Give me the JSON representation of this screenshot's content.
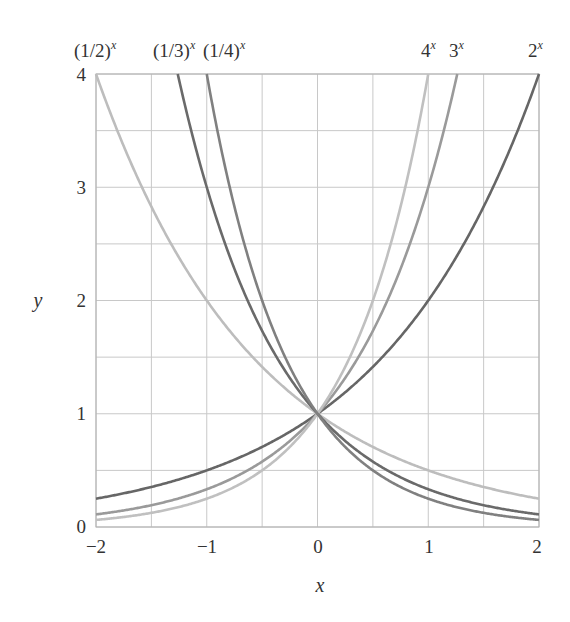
{
  "chart_data": {
    "type": "line",
    "title": "",
    "xlabel": "x",
    "ylabel": "y",
    "xlim": [
      -2,
      2
    ],
    "ylim": [
      0,
      4
    ],
    "grid": true,
    "grid_step": 0.5,
    "x_ticks": [
      "−2",
      "−1",
      "0",
      "1",
      "2"
    ],
    "x_tick_values": [
      -2,
      -1,
      0,
      1,
      2
    ],
    "y_ticks": [
      "0",
      "1",
      "2",
      "3",
      "4"
    ],
    "y_tick_values": [
      0,
      1,
      2,
      3,
      4
    ],
    "legend_position": "curve labels at top",
    "series": [
      {
        "name": "2^x",
        "label_base": "2",
        "base": 2,
        "color": "#666666",
        "x": [
          -2,
          -1,
          0,
          1,
          2
        ],
        "values": [
          0.25,
          0.5,
          1,
          2,
          4
        ]
      },
      {
        "name": "3^x",
        "label_base": "3",
        "base": 3,
        "color": "#9a9a9a",
        "x": [
          -2,
          -1,
          0,
          1,
          1.26
        ],
        "values": [
          0.111,
          0.333,
          1,
          3,
          4
        ]
      },
      {
        "name": "4^x",
        "label_base": "4",
        "base": 4,
        "color": "#c0c0c0",
        "x": [
          -2,
          -1,
          0,
          1
        ],
        "values": [
          0.0625,
          0.25,
          1,
          4
        ]
      },
      {
        "name": "(1/2)^x",
        "label_base": "(1/2)",
        "base": 0.5,
        "color": "#bdbdbd",
        "x": [
          -2,
          -1,
          0,
          1,
          2
        ],
        "values": [
          4,
          2,
          1,
          0.5,
          0.25
        ]
      },
      {
        "name": "(1/3)^x",
        "label_base": "(1/3)",
        "base": 0.3333333,
        "color": "#6a6a6a",
        "x": [
          -1.26,
          -1,
          0,
          1,
          2
        ],
        "values": [
          4,
          3,
          1,
          0.333,
          0.111
        ]
      },
      {
        "name": "(1/4)^x",
        "label_base": "(1/4)",
        "base": 0.25,
        "color": "#808080",
        "x": [
          -1,
          0,
          1,
          2
        ],
        "values": [
          4,
          1,
          0.25,
          0.0625
        ]
      }
    ],
    "labels": {
      "exponent": "x",
      "half": "(1/2)",
      "third": "(1/3)",
      "quarter": "(1/4)",
      "four": "4",
      "three": "3",
      "two": "2"
    },
    "colors": {
      "grid": "#c8c8c8",
      "frame": "#b0b0b0",
      "text": "#333333"
    }
  }
}
